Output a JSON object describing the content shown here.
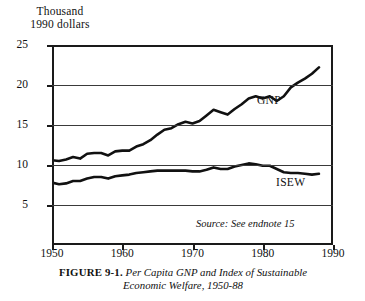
{
  "figure": {
    "axis_title_lines": [
      "Thousand",
      "1990 dollars"
    ],
    "caption_figure_number": "FIGURE 9-1.",
    "caption_line1": "Per Capita GNP and Index of Sustainable",
    "caption_line2": "Economic Welfare, 1950-88",
    "source_note": "Source: See endnote 15",
    "line_color": "#111111",
    "grid_color": "#3a3a3a",
    "frame_color": "#1a1a1a",
    "background": "#ffffff"
  },
  "chart_data": {
    "type": "line",
    "title": "Per Capita GNP and Index of Sustainable Economic Welfare, 1950-88",
    "xlabel": "",
    "ylabel": "Thousand 1990 dollars",
    "xlim": [
      1950,
      1990
    ],
    "ylim": [
      0,
      25
    ],
    "xticks": [
      1950,
      1960,
      1970,
      1980,
      1990
    ],
    "yticks": [
      5,
      10,
      15,
      20,
      25
    ],
    "grid": true,
    "legend": "inline-labels",
    "annotations": [
      "Source: See endnote 15"
    ],
    "x": [
      1950,
      1951,
      1952,
      1953,
      1954,
      1955,
      1956,
      1957,
      1958,
      1959,
      1960,
      1961,
      1962,
      1963,
      1964,
      1965,
      1966,
      1967,
      1968,
      1969,
      1970,
      1971,
      1972,
      1973,
      1974,
      1975,
      1976,
      1977,
      1978,
      1979,
      1980,
      1981,
      1982,
      1983,
      1984,
      1985,
      1986,
      1987,
      1988
    ],
    "series": [
      {
        "name": "GNP",
        "label_x": 1979,
        "label_y": 17.4,
        "values": [
          10.6,
          10.5,
          10.7,
          11.0,
          10.8,
          11.4,
          11.5,
          11.5,
          11.2,
          11.7,
          11.8,
          11.8,
          12.3,
          12.6,
          13.1,
          13.8,
          14.4,
          14.6,
          15.1,
          15.4,
          15.2,
          15.5,
          16.2,
          16.9,
          16.6,
          16.3,
          17.0,
          17.6,
          18.3,
          18.6,
          18.3,
          18.6,
          18.0,
          18.6,
          19.7,
          20.3,
          20.8,
          21.4,
          22.2
        ]
      },
      {
        "name": "ISEW",
        "label_x": 1982,
        "label_y": 6.6,
        "values": [
          7.8,
          7.6,
          7.7,
          8.0,
          8.0,
          8.3,
          8.5,
          8.5,
          8.3,
          8.6,
          8.7,
          8.8,
          9.0,
          9.1,
          9.2,
          9.3,
          9.3,
          9.3,
          9.3,
          9.3,
          9.2,
          9.2,
          9.4,
          9.7,
          9.5,
          9.5,
          9.8,
          10.0,
          10.2,
          10.1,
          9.9,
          9.9,
          9.5,
          9.1,
          9.0,
          9.0,
          8.9,
          8.8,
          8.9
        ]
      }
    ]
  }
}
